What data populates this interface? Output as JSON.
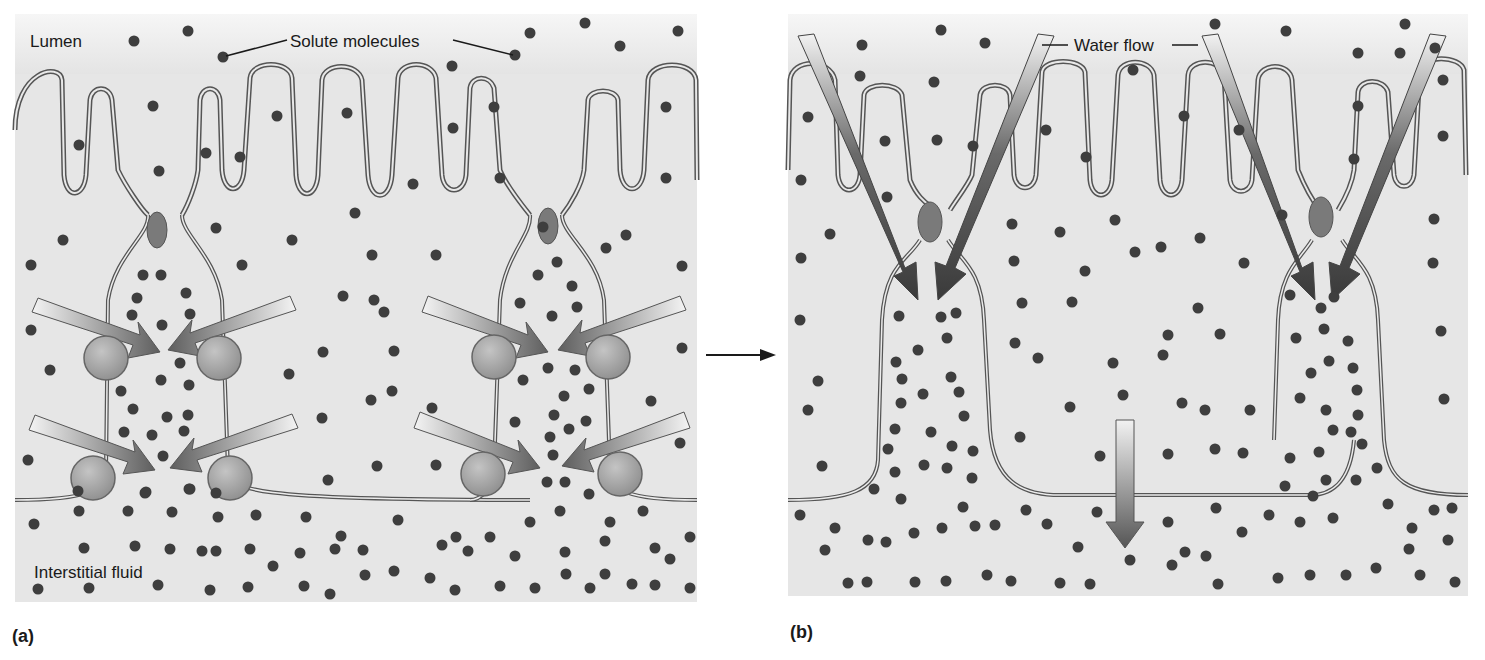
{
  "figure": {
    "panels": [
      {
        "id": "a",
        "letter": "(a)",
        "labels": {
          "lumen": "Lumen",
          "solute": "Solute molecules",
          "interstitial": "Interstitial fluid"
        },
        "description": "Solute pumped into lateral intercellular space by membrane carriers"
      },
      {
        "id": "b",
        "letter": "(b)",
        "labels": {
          "water": "Water flow"
        },
        "description": "Water follows solute through tight junctions; fluid moves toward interstitial fluid"
      }
    ],
    "transition_arrow": "panel-a-to-panel-b"
  },
  "colors": {
    "background": "#ffffff",
    "cell_fill": "#e2e2e2",
    "lumen_fill": "#f2f2f2",
    "membrane": "#5a5a5a",
    "solute_dot": "#3e3e3e",
    "pump": "#a8a8a8",
    "tight_junction": "#7a7a7a",
    "arrow_dark": "#4a4a4a"
  }
}
